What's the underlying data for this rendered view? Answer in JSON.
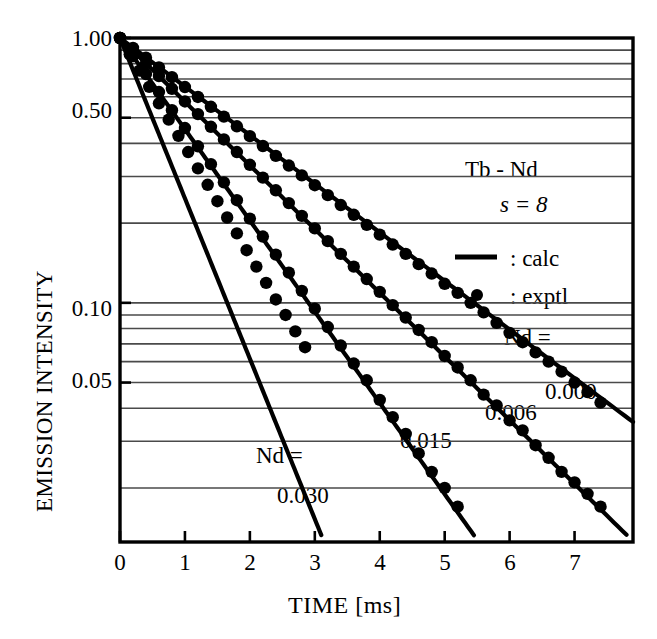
{
  "chart_data": {
    "type": "line",
    "title": "",
    "xlabel": "TIME [ms]",
    "ylabel": "EMISSION INTENSITY",
    "xlim": [
      0,
      7.9
    ],
    "ylim": [
      0.0125,
      1.0
    ],
    "yscale": "log",
    "grid": "horizontal-log-minor",
    "legend_position": "inside-right",
    "xticks": [
      "0",
      "1",
      "2",
      "3",
      "4",
      "5",
      "6",
      "7"
    ],
    "xtick_values": [
      0,
      1,
      2,
      3,
      4,
      5,
      6,
      7
    ],
    "yticks": [
      "1.00",
      "0.50",
      "0.10",
      "0.05"
    ],
    "ytick_values": [
      1.0,
      0.5,
      0.1,
      0.05
    ],
    "gridline_values": [
      0.9,
      0.8,
      0.7,
      0.6,
      0.5,
      0.4,
      0.3,
      0.2,
      0.1,
      0.09,
      0.08,
      0.07,
      0.06,
      0.05,
      0.04,
      0.03,
      0.02
    ],
    "series": [
      {
        "name": "Nd = 0.000",
        "label": "0.000",
        "label_prefix": "Nd =",
        "decay_per_ms": 0.1835,
        "x_end": 7.9,
        "marker": "filled-circle",
        "x": [
          0,
          0.2,
          0.4,
          0.6,
          0.8,
          1.0,
          1.2,
          1.4,
          1.6,
          1.8,
          2.0,
          2.2,
          2.4,
          2.6,
          2.8,
          3.0,
          3.2,
          3.4,
          3.6,
          3.8,
          4.0,
          4.2,
          4.4,
          4.6,
          4.8,
          5.0,
          5.2,
          5.4,
          5.6,
          5.8,
          6.0,
          6.2,
          6.4,
          6.6,
          6.8,
          7.0,
          7.2,
          7.4
        ],
        "y": [
          1.0,
          0.918,
          0.843,
          0.774,
          0.711,
          0.653,
          0.599,
          0.55,
          0.505,
          0.464,
          0.426,
          0.391,
          0.359,
          0.33,
          0.303,
          0.278,
          0.255,
          0.234,
          0.215,
          0.197,
          0.181,
          0.166,
          0.153,
          0.14,
          0.129,
          0.118,
          0.109,
          0.1,
          0.092,
          0.084,
          0.077,
          0.071,
          0.065,
          0.06,
          0.055,
          0.05,
          0.046,
          0.042
        ]
      },
      {
        "name": "Nd = 0.006",
        "label": "0.006",
        "label_prefix": "",
        "decay_per_ms": 0.2405,
        "x_end": 7.8,
        "marker": "filled-circle",
        "x": [
          0,
          0.2,
          0.4,
          0.6,
          0.8,
          1.0,
          1.2,
          1.4,
          1.6,
          1.8,
          2.0,
          2.2,
          2.4,
          2.6,
          2.8,
          3.0,
          3.2,
          3.4,
          3.6,
          3.8,
          4.0,
          4.2,
          4.4,
          4.6,
          4.8,
          5.0,
          5.2,
          5.4,
          5.6,
          5.8,
          6.0,
          6.2,
          6.4,
          6.6,
          6.8,
          7.0,
          7.2,
          7.4
        ],
        "y": [
          1.0,
          0.895,
          0.802,
          0.718,
          0.643,
          0.576,
          0.516,
          0.462,
          0.414,
          0.371,
          0.332,
          0.297,
          0.266,
          0.238,
          0.213,
          0.191,
          0.171,
          0.153,
          0.137,
          0.123,
          0.11,
          0.098,
          0.088,
          0.079,
          0.071,
          0.063,
          0.057,
          0.051,
          0.045,
          0.041,
          0.036,
          0.033,
          0.029,
          0.026,
          0.023,
          0.021,
          0.019,
          0.017
        ]
      },
      {
        "name": "Nd = 0.015",
        "label": "0.015",
        "label_prefix": "",
        "decay_per_ms": 0.3445,
        "x_end": 5.45,
        "marker": "filled-circle",
        "x": [
          0,
          0.2,
          0.4,
          0.6,
          0.8,
          1.0,
          1.2,
          1.4,
          1.6,
          1.8,
          2.0,
          2.2,
          2.4,
          2.6,
          2.8,
          3.0,
          3.2,
          3.4,
          3.6,
          3.8,
          4.0,
          4.2,
          4.4,
          4.6,
          4.8,
          5.0,
          5.2
        ],
        "y": [
          1.0,
          0.855,
          0.731,
          0.625,
          0.534,
          0.457,
          0.39,
          0.334,
          0.285,
          0.244,
          0.208,
          0.178,
          0.152,
          0.13,
          0.111,
          0.095,
          0.081,
          0.069,
          0.059,
          0.051,
          0.043,
          0.037,
          0.032,
          0.027,
          0.023,
          0.02,
          0.017
        ]
      },
      {
        "name": "Nd = 0.030",
        "label": "0.030",
        "label_prefix": "Nd =",
        "decay_per_ms": 0.6055,
        "x_end": 3.1,
        "marker": "filled-circle",
        "x": [
          0,
          0.15,
          0.3,
          0.45,
          0.6,
          0.75,
          0.9,
          1.05,
          1.2,
          1.35,
          1.5,
          1.65,
          1.8,
          1.95,
          2.1,
          2.25,
          2.4,
          2.55,
          2.7,
          2.85
        ],
        "y": [
          1.0,
          0.868,
          0.753,
          0.654,
          0.567,
          0.492,
          0.427,
          0.371,
          0.322,
          0.279,
          0.242,
          0.21,
          0.183,
          0.158,
          0.137,
          0.119,
          0.103,
          0.09,
          0.078,
          0.068
        ]
      }
    ],
    "annotations": [
      {
        "id": "sample",
        "text": "Tb - Nd",
        "italic": false
      },
      {
        "id": "s-value",
        "text": "s = 8",
        "italic": true
      },
      {
        "id": "legend-calc",
        "text": ": calc",
        "marker": "line"
      },
      {
        "id": "legend-exptl",
        "text": ": exptl",
        "marker": "dot"
      },
      {
        "id": "nd-label-right",
        "text": "Nd ="
      },
      {
        "id": "curve-0",
        "text": "0.000"
      },
      {
        "id": "curve-1",
        "text": "0.006"
      },
      {
        "id": "curve-2",
        "text": "0.015"
      },
      {
        "id": "nd-label-left",
        "text": "Nd ="
      },
      {
        "id": "curve-3",
        "text": "0.030"
      }
    ],
    "colors": {
      "ink": "#000000",
      "grid": "#4a4a4a",
      "background": "#ffffff"
    }
  }
}
